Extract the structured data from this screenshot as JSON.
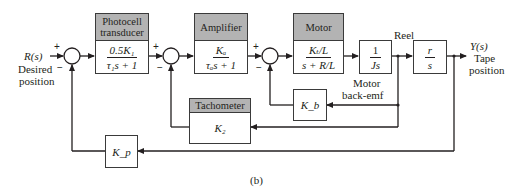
{
  "diagram": {
    "type": "block-diagram",
    "caption": "(b)",
    "input": {
      "signal": "R(s)",
      "label_line1": "Desired",
      "label_line2": "position"
    },
    "output": {
      "signal": "Y(s)",
      "label_line1": "Tape",
      "label_line2": "position"
    },
    "blocks": {
      "photocell": {
        "title_line1": "Photocell",
        "title_line2": "transducer",
        "numerator": "0.5K₁",
        "denominator": "τ₁s + 1"
      },
      "amplifier": {
        "title": "Amplifier",
        "numerator": "Kₐ",
        "denominator": "τₐs + 1"
      },
      "motor": {
        "title": "Motor",
        "numerator": "Kₜ/L",
        "denominator": "s + R/L"
      },
      "inertia": {
        "numerator": "1",
        "denominator": "Js"
      },
      "reel": {
        "title": "Reel",
        "numerator": "r",
        "denominator": "s"
      },
      "back_emf": {
        "gain": "K_b",
        "label_line1": "Motor",
        "label_line2": "back-emf"
      },
      "tachometer": {
        "title": "Tachometer",
        "gain": "K₂"
      },
      "position_feedback": {
        "gain": "K_p"
      }
    },
    "summing_junctions": [
      {
        "id": "sum1",
        "signs": [
          "+",
          "−"
        ]
      },
      {
        "id": "sum2",
        "signs": [
          "+",
          "−"
        ]
      },
      {
        "id": "sum3",
        "signs": [
          "+",
          "−"
        ]
      }
    ],
    "colors": {
      "line": "#231f20",
      "header_fill": "#b3b3b3",
      "box_border": "#3a3a3a"
    }
  }
}
